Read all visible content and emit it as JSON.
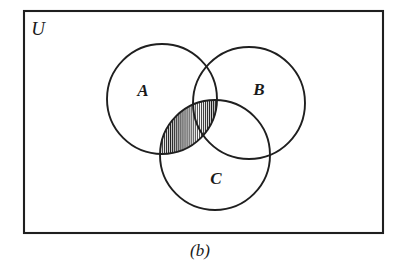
{
  "figure": {
    "kind": "venn-diagram",
    "caption": "(b)",
    "universe_label": "U",
    "background_color": "#ffffff",
    "line_color": "#1f1f1f",
    "hatch_color": "#1f1f1f"
  },
  "universe": {
    "label": "U",
    "x": 24,
    "y": 11,
    "width": 359,
    "height": 222,
    "label_x": 38,
    "label_y": 35
  },
  "sets": [
    {
      "id": "A",
      "label": "A",
      "cx": 162,
      "cy": 99,
      "r": 55,
      "label_x": 143,
      "label_y": 96
    },
    {
      "id": "B",
      "label": "B",
      "cx": 249,
      "cy": 103,
      "r": 56,
      "label_x": 259,
      "label_y": 95
    },
    {
      "id": "C",
      "label": "C",
      "cx": 215,
      "cy": 155,
      "r": 55,
      "label_x": 216,
      "label_y": 184
    }
  ],
  "shaded": {
    "region_name": "A-intersect-C",
    "pattern": "vertical-hatching",
    "hatch_spacing_px": 2,
    "hatch_stroke_width_px": 1
  },
  "caption": {
    "text": "(b)",
    "x": 200,
    "y": 256
  }
}
